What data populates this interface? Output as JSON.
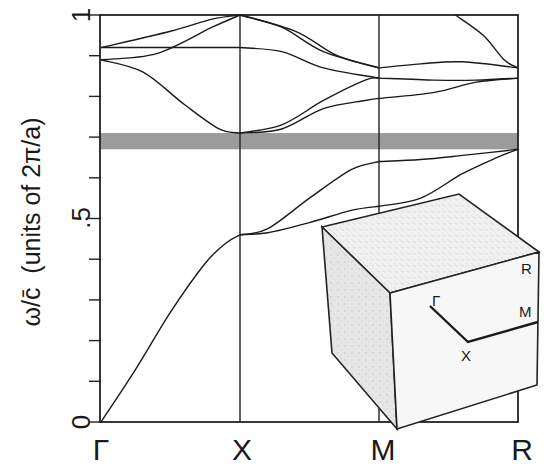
{
  "chart_data": {
    "type": "line",
    "title": "",
    "xlabel": "",
    "ylabel": "ω/c̄  (units of 2π/a)",
    "ylim": [
      0,
      1
    ],
    "x_ticks": [
      {
        "label": "Γ",
        "pos": 0
      },
      {
        "label": "X",
        "pos": 1
      },
      {
        "label": "M",
        "pos": 2
      },
      {
        "label": "R",
        "pos": 3
      }
    ],
    "y_tick_labels": [
      {
        "label": "0",
        "value": 0
      },
      {
        "label": ".5",
        "value": 0.5
      },
      {
        "label": "1",
        "value": 1
      }
    ],
    "y_minor_tick_step": 0.1,
    "grid": false,
    "band_gap": {
      "from": 0.67,
      "to": 0.71,
      "label": "complete photonic band gap"
    },
    "series": [
      {
        "name": "band-1 Γ-X",
        "x": [
          0,
          0.25,
          0.5,
          0.75,
          0.9,
          1.0
        ],
        "y": [
          0,
          0.13,
          0.27,
          0.39,
          0.44,
          0.46
        ]
      },
      {
        "name": "band-1 X-M",
        "x": [
          1.0,
          1.2,
          1.5,
          1.8,
          2.0
        ],
        "y": [
          0.46,
          0.465,
          0.49,
          0.52,
          0.53
        ]
      },
      {
        "name": "band-1 M-R",
        "x": [
          2.0,
          2.3,
          2.6,
          2.85,
          3.0
        ],
        "y": [
          0.53,
          0.55,
          0.61,
          0.65,
          0.67
        ]
      },
      {
        "name": "band-2 X-M",
        "x": [
          1.0,
          1.2,
          1.5,
          1.8,
          2.0
        ],
        "y": [
          0.46,
          0.475,
          0.55,
          0.62,
          0.64
        ]
      },
      {
        "name": "band-2 M-R",
        "x": [
          2.0,
          2.3,
          2.6,
          3.0
        ],
        "y": [
          0.64,
          0.645,
          0.655,
          0.67
        ]
      },
      {
        "name": "band-3 Γ-X",
        "x": [
          0,
          0.3,
          0.6,
          0.85,
          1.0
        ],
        "y": [
          0.89,
          0.86,
          0.78,
          0.72,
          0.71
        ]
      },
      {
        "name": "band-3 X-M",
        "x": [
          1.0,
          1.3,
          1.6,
          1.9,
          2.0
        ],
        "y": [
          0.71,
          0.72,
          0.77,
          0.79,
          0.795
        ]
      },
      {
        "name": "band-3 M-R",
        "x": [
          2.0,
          2.4,
          2.7,
          3.0
        ],
        "y": [
          0.795,
          0.81,
          0.835,
          0.845
        ]
      },
      {
        "name": "band-4 X-M",
        "x": [
          1.0,
          1.3,
          1.6,
          1.9,
          2.0
        ],
        "y": [
          0.71,
          0.73,
          0.79,
          0.84,
          0.845
        ]
      },
      {
        "name": "band-4 M-R",
        "x": [
          2.0,
          2.4,
          2.7,
          3.0
        ],
        "y": [
          0.845,
          0.84,
          0.84,
          0.845
        ]
      },
      {
        "name": "band-5 Γ-X",
        "x": [
          0,
          0.4,
          0.8,
          1.0
        ],
        "y": [
          0.92,
          0.92,
          0.92,
          0.92
        ]
      },
      {
        "name": "band-5 X-M",
        "x": [
          1.0,
          1.3,
          1.6,
          2.0
        ],
        "y": [
          0.92,
          0.91,
          0.87,
          0.845
        ]
      },
      {
        "name": "band-6 Γ-X",
        "x": [
          0,
          0.4,
          0.8,
          1.0
        ],
        "y": [
          0.89,
          0.905,
          0.97,
          1.0
        ]
      },
      {
        "name": "band-6 X-M",
        "x": [
          1.0,
          1.3,
          1.6,
          2.0
        ],
        "y": [
          1.0,
          0.97,
          0.91,
          0.87
        ]
      },
      {
        "name": "band-6 M-R",
        "x": [
          2.0,
          2.3,
          2.6,
          3.0
        ],
        "y": [
          0.87,
          0.88,
          0.885,
          0.87
        ]
      },
      {
        "name": "band-7 Γ-X",
        "x": [
          0,
          0.5,
          0.8,
          1.0
        ],
        "y": [
          0.92,
          0.96,
          0.99,
          1.0
        ]
      },
      {
        "name": "band-7 X-M",
        "x": [
          1.0,
          1.4,
          1.7,
          2.0
        ],
        "y": [
          1.0,
          0.96,
          0.9,
          0.87
        ]
      },
      {
        "name": "band-8 M-R",
        "x": [
          2.55,
          2.75,
          2.9,
          3.0
        ],
        "y": [
          1.0,
          0.95,
          0.89,
          0.87
        ]
      }
    ]
  },
  "inset": {
    "name": "Brillouin zone (simple cubic)",
    "labels": {
      "gamma": "Γ",
      "x": "X",
      "m": "M",
      "r": "R"
    }
  }
}
